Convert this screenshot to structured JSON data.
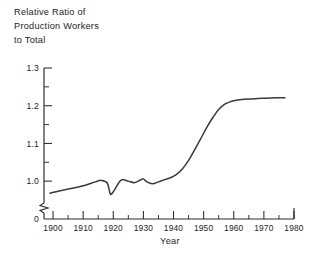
{
  "chart_data": {
    "type": "line",
    "title": "Relative Ratio of Production Workers to Total",
    "title_lines": [
      "Relative Ratio of",
      "Production Workers",
      "to Total"
    ],
    "xlabel": "Year",
    "ylabel": "",
    "xlim": [
      1897,
      1980
    ],
    "ylim": [
      0.95,
      1.3
    ],
    "grid": false,
    "legend": false,
    "axis_break": true,
    "axis_break_label": "0",
    "line_color": "#3a3a3a",
    "axis_color": "#2b2b2b",
    "ytick_labels": [
      "1.3",
      "1.2",
      "1.1",
      "1.0",
      "0"
    ],
    "ytick_values": [
      1.3,
      1.2,
      1.1,
      1.0
    ],
    "yminor_values": [
      1.05,
      1.15,
      1.25
    ],
    "xtick_labels": [
      "1900",
      "1910",
      "1920",
      "1930",
      "1940",
      "1950",
      "1960",
      "1970",
      "1980"
    ],
    "xtick_values": [
      1900,
      1910,
      1920,
      1930,
      1940,
      1950,
      1960,
      1970,
      1980
    ],
    "xminor_values": [
      1905,
      1915,
      1925,
      1935,
      1945,
      1955,
      1965,
      1975
    ],
    "series": [
      {
        "name": "Relative ratio of production workers to total",
        "x": [
          1899,
          1902,
          1905,
          1908,
          1911,
          1914,
          1916,
          1918,
          1919,
          1920,
          1921,
          1922,
          1923,
          1925,
          1927,
          1929,
          1930,
          1931,
          1933,
          1935,
          1937,
          1939,
          1941,
          1943,
          1945,
          1947,
          1949,
          1951,
          1953,
          1955,
          1957,
          1959,
          1960,
          1962,
          1965,
          1968,
          1971,
          1974,
          1977
        ],
        "y": [
          0.968,
          0.974,
          0.979,
          0.984,
          0.99,
          0.998,
          1.002,
          0.995,
          0.966,
          0.972,
          0.985,
          0.998,
          1.004,
          1.0,
          0.996,
          1.003,
          1.006,
          0.999,
          0.993,
          0.998,
          1.004,
          1.009,
          1.018,
          1.033,
          1.055,
          1.083,
          1.112,
          1.142,
          1.168,
          1.19,
          1.204,
          1.211,
          1.213,
          1.216,
          1.218,
          1.219,
          1.22,
          1.221,
          1.221
        ]
      }
    ]
  }
}
